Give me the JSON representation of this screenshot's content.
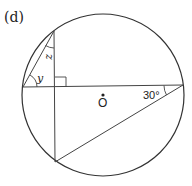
{
  "figure": {
    "label": "(d)",
    "center_label": "O",
    "angle_labels": {
      "z": "z",
      "y": "y",
      "thirty": "30°"
    },
    "circle": {
      "cx": 103,
      "cy": 95,
      "r": 81
    },
    "points": {
      "top_vertex": [
        54,
        31
      ],
      "left_end": [
        23,
        87
      ],
      "right_end": [
        183,
        85
      ],
      "bottom_vertex": [
        55,
        162
      ],
      "foot": [
        54,
        87
      ]
    },
    "colors": {
      "stroke": "#333333",
      "text": "#222222"
    }
  }
}
